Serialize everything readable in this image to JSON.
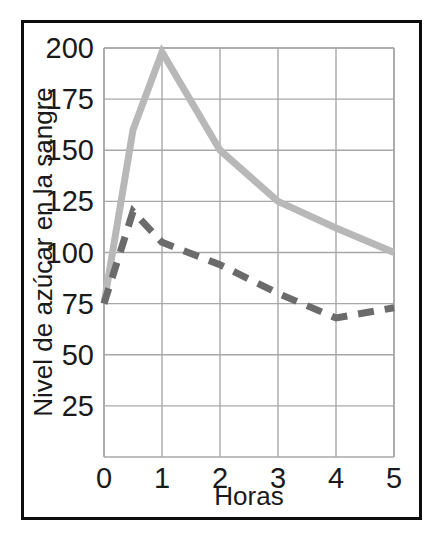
{
  "figure": {
    "border_color": "#0d0d0d",
    "background": "#ffffff"
  },
  "chart_data": {
    "type": "line",
    "title": "",
    "xlabel": "Horas",
    "ylabel": "Nivel de azúcar en la sangre",
    "xlim": [
      0,
      5
    ],
    "ylim": [
      0,
      200
    ],
    "xticks": [
      0,
      1,
      2,
      3,
      4,
      5
    ],
    "xtick_labels": [
      "0",
      "1",
      "2",
      "3",
      "4",
      "5"
    ],
    "yticks": [
      25,
      50,
      75,
      100,
      125,
      150,
      175,
      200
    ],
    "ytick_labels": [
      "25",
      "50",
      "75",
      "100",
      "125",
      "150",
      "175",
      "200"
    ],
    "grid": true,
    "grid_color": "#a8a8a8",
    "legend": null,
    "series": [
      {
        "name": "linea-solida-clara",
        "style": "solid",
        "color": "#b8b8b8",
        "width": 7,
        "x": [
          0,
          0.5,
          1,
          2,
          3,
          4,
          5
        ],
        "values": [
          75,
          160,
          198,
          150,
          125,
          112,
          100
        ]
      },
      {
        "name": "linea-discontinua-oscura",
        "style": "dashed",
        "color": "#6b6b6b",
        "width": 7,
        "x": [
          0,
          0.5,
          1,
          2,
          3,
          4,
          5
        ],
        "values": [
          75,
          120,
          105,
          94,
          80,
          68,
          73
        ]
      }
    ]
  }
}
